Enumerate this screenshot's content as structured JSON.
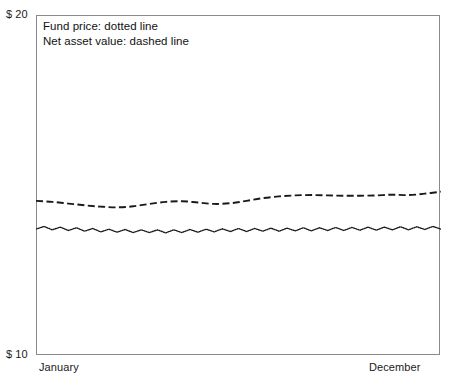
{
  "chart_data": {
    "type": "line",
    "title": "",
    "xlabel": "",
    "ylabel": "",
    "ylim": [
      10,
      20
    ],
    "ytick_labels": [
      "$ 20",
      "$ 10"
    ],
    "xtick_labels": [
      "January",
      "December"
    ],
    "grid": false,
    "legend_position": "top-left-inside",
    "annotations": [
      "Fund price: dotted line",
      "Net asset value: dashed line"
    ],
    "series": [
      {
        "name": "Net asset value",
        "style": "dashed",
        "color": "#1a1a1a",
        "x": [
          0,
          4,
          8,
          12,
          16,
          20,
          24,
          28,
          32,
          36,
          40,
          44,
          48,
          52,
          56,
          60,
          64,
          68,
          72,
          76,
          80,
          84,
          88,
          92,
          96,
          100
        ],
        "values": [
          14.55,
          14.52,
          14.47,
          14.42,
          14.38,
          14.36,
          14.39,
          14.46,
          14.52,
          14.54,
          14.5,
          14.46,
          14.48,
          14.55,
          14.63,
          14.68,
          14.71,
          14.72,
          14.71,
          14.7,
          14.7,
          14.71,
          14.73,
          14.72,
          14.76,
          14.82
        ]
      },
      {
        "name": "Fund price",
        "style": "dotted",
        "color": "#1a1a1a",
        "x": [
          0,
          2,
          4,
          6,
          8,
          10,
          12,
          14,
          16,
          18,
          20,
          22,
          24,
          26,
          28,
          30,
          32,
          34,
          36,
          38,
          40,
          42,
          44,
          46,
          48,
          50,
          52,
          54,
          56,
          58,
          60,
          62,
          64,
          66,
          68,
          70,
          72,
          74,
          76,
          78,
          80,
          82,
          84,
          86,
          88,
          90,
          92,
          94,
          96,
          98,
          100
        ],
        "values": [
          13.72,
          13.8,
          13.7,
          13.78,
          13.68,
          13.76,
          13.66,
          13.74,
          13.64,
          13.72,
          13.63,
          13.71,
          13.62,
          13.7,
          13.62,
          13.7,
          13.61,
          13.7,
          13.62,
          13.71,
          13.63,
          13.72,
          13.64,
          13.73,
          13.65,
          13.74,
          13.65,
          13.74,
          13.66,
          13.75,
          13.66,
          13.75,
          13.67,
          13.76,
          13.67,
          13.76,
          13.68,
          13.77,
          13.68,
          13.77,
          13.69,
          13.78,
          13.69,
          13.78,
          13.7,
          13.79,
          13.7,
          13.79,
          13.71,
          13.8,
          13.72
        ]
      }
    ]
  },
  "axes": {
    "y_top_label": "$ 20",
    "y_bottom_label": "$ 10",
    "x_left_label": "January",
    "x_right_label": "December"
  },
  "legend": {
    "line1": "Fund price: dotted line",
    "line2": "Net asset value: dashed line"
  },
  "colors": {
    "frame": "#8a8a8a",
    "ink": "#1a1a1a",
    "background": "#ffffff"
  }
}
